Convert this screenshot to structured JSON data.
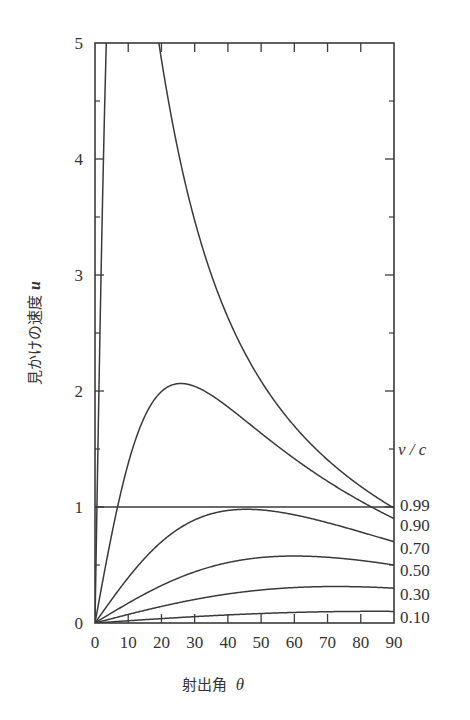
{
  "chart_data": {
    "type": "line",
    "title": "",
    "xlabel": "射出角 θ",
    "xlabel_text": "射出角",
    "xlabel_symbol": "θ",
    "ylabel": "見かけの速度u",
    "ylabel_text": "見かけの速度",
    "ylabel_symbol": "u",
    "xlim": [
      0,
      90
    ],
    "ylim": [
      0,
      5
    ],
    "x_ticks": [
      0,
      10,
      20,
      30,
      40,
      50,
      60,
      70,
      80,
      90
    ],
    "x_tick_labels": [
      "0",
      "10",
      "20",
      "30",
      "40",
      "50",
      "60",
      "70",
      "80",
      "90"
    ],
    "y_ticks": [
      0,
      1,
      2,
      3,
      4,
      5
    ],
    "y_tick_labels": [
      "0",
      "1",
      "2",
      "3",
      "4",
      "5"
    ],
    "y_minor_ticks": [
      0.5,
      1.5,
      2.5,
      3.5,
      4.5
    ],
    "grid": false,
    "formula": "u = β sinθ / (1 − β cosθ)",
    "legend": {
      "title": "v / c",
      "position": "right-edge"
    },
    "reference_line": {
      "y": 1,
      "label": "u = 1"
    },
    "series": [
      {
        "name": "0.99",
        "beta": 0.99,
        "label": "0.99",
        "x": [
          0,
          2,
          5,
          8,
          10,
          15,
          20,
          30,
          40,
          50,
          60,
          70,
          80,
          90
        ],
        "values": [
          0,
          3.16,
          6.07,
          7.04,
          6.78,
          5.02,
          3.73,
          2.26,
          1.55,
          1.17,
          0.97,
          0.86,
          0.8,
          0.99
        ]
      },
      {
        "name": "0.90",
        "beta": 0.9,
        "label": "0.90",
        "x": [
          0,
          10,
          20,
          26,
          30,
          40,
          50,
          60,
          70,
          80,
          90
        ],
        "values": [
          0,
          1.38,
          1.99,
          2.06,
          2.03,
          1.73,
          1.37,
          1.42,
          1.23,
          1.06,
          0.9
        ]
      },
      {
        "name": "0.70",
        "beta": 0.7,
        "label": "0.70",
        "x": [
          0,
          10,
          20,
          30,
          40,
          45,
          50,
          60,
          70,
          80,
          90
        ],
        "values": [
          0,
          0.39,
          0.7,
          0.9,
          0.98,
          0.98,
          0.97,
          0.93,
          0.87,
          0.79,
          0.7
        ]
      },
      {
        "name": "0.50",
        "beta": 0.5,
        "label": "0.50",
        "x": [
          0,
          10,
          20,
          30,
          40,
          50,
          60,
          70,
          80,
          90
        ],
        "values": [
          0,
          0.17,
          0.32,
          0.44,
          0.52,
          0.57,
          0.58,
          0.57,
          0.54,
          0.5
        ]
      },
      {
        "name": "0.30",
        "beta": 0.3,
        "label": "0.30",
        "x": [
          0,
          10,
          20,
          30,
          40,
          50,
          60,
          70,
          80,
          90
        ],
        "values": [
          0,
          0.07,
          0.14,
          0.21,
          0.25,
          0.28,
          0.3,
          0.31,
          0.31,
          0.3
        ]
      },
      {
        "name": "0.10",
        "beta": 0.1,
        "label": "0.10",
        "x": [
          0,
          10,
          20,
          30,
          40,
          50,
          60,
          70,
          80,
          90
        ],
        "values": [
          0,
          0.019,
          0.038,
          0.055,
          0.07,
          0.082,
          0.091,
          0.097,
          0.1,
          0.1
        ]
      }
    ]
  },
  "style": {
    "line_color": "#3a3a3a",
    "axis_color": "#3a3a3a",
    "text_color": "#333333",
    "background": "#ffffff"
  }
}
